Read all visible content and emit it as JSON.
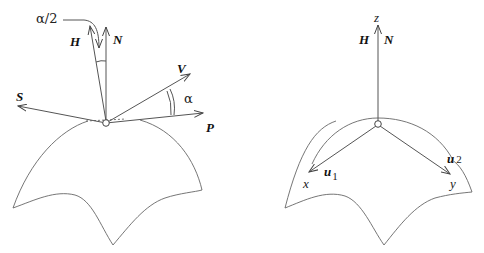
{
  "left_diagram": {
    "vectors": {
      "H": "H",
      "N": "N",
      "S": "S",
      "V": "V",
      "P": "P"
    },
    "angle_half": "α/2",
    "angle_full": "α"
  },
  "right_diagram": {
    "axis_z": "z",
    "vector_H": "H",
    "vector_N": "N",
    "u1_base": "u",
    "u1_sub": "1",
    "u2_base": "u",
    "u2_sub": "2",
    "axis_x": "x",
    "axis_y": "y"
  },
  "colors": {
    "stroke": "#555555",
    "text": "#111111",
    "background": "#ffffff"
  }
}
